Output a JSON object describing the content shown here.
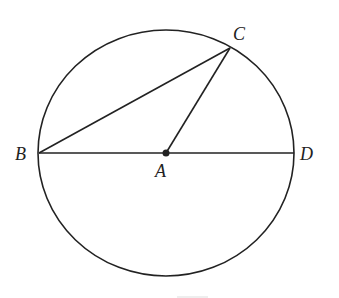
{
  "diagram": {
    "type": "circle-geometry",
    "circle": {
      "center": "A",
      "cx": 166,
      "cy": 153,
      "rx": 128,
      "ry": 123
    },
    "points": [
      {
        "name": "A",
        "x": 166,
        "y": 153,
        "label": "A"
      },
      {
        "name": "B",
        "x": 39,
        "y": 153,
        "label": "B"
      },
      {
        "name": "C",
        "x": 230,
        "y": 48,
        "label": "C"
      },
      {
        "name": "D",
        "x": 294,
        "y": 153,
        "label": "D"
      }
    ],
    "segments": [
      "BD",
      "BC",
      "AC"
    ],
    "stroke_color": "#222222"
  }
}
